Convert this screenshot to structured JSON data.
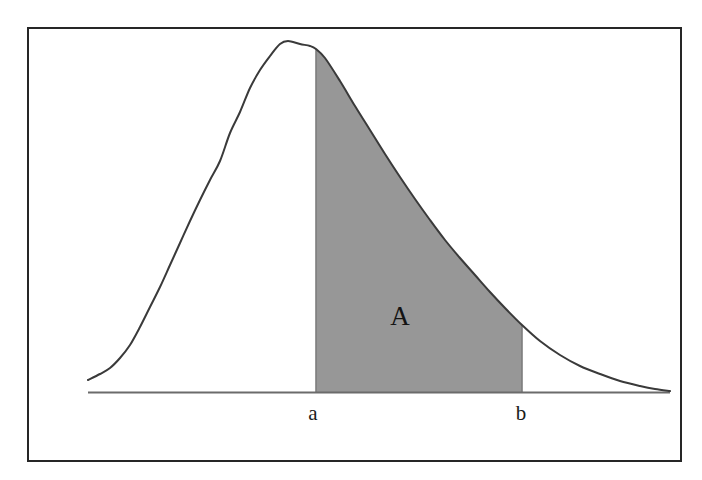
{
  "figure": {
    "title": "",
    "region_label": "A",
    "labels": {
      "lower_bound": "a",
      "upper_bound": "b"
    },
    "colors": {
      "frame": "#262626",
      "curve": "#3a3a3a",
      "shaded_region": "#979797",
      "baseline": "#6b6b6b",
      "background": "#ffffff",
      "text": "#141414"
    }
  },
  "chart_data": {
    "type": "area",
    "title": "",
    "subtitle": "",
    "xlabel": "",
    "ylabel": "",
    "grid": false,
    "legend_position": "none",
    "xlim": [
      88,
      670
    ],
    "ylim": [
      392,
      41
    ],
    "shaded_interval": {
      "from_label": "a",
      "to_label": "b",
      "from_x": 316,
      "to_x": 522,
      "fill": "#979797",
      "area_label": "A"
    },
    "annotations": [
      {
        "text": "a",
        "x": 313,
        "y": 413,
        "role": "x-tick-label"
      },
      {
        "text": "b",
        "x": 521,
        "y": 413,
        "role": "x-tick-label"
      },
      {
        "text": "A",
        "x": 400,
        "y": 317,
        "role": "area-label"
      }
    ],
    "baseline": {
      "y": 392,
      "x_start": 88,
      "x_end": 670
    },
    "curve_name": "right-skewed density curve",
    "x": [
      88,
      100,
      110,
      120,
      130,
      140,
      150,
      160,
      170,
      180,
      190,
      200,
      210,
      220,
      230,
      240,
      250,
      260,
      270,
      280,
      288,
      300,
      310,
      316,
      325,
      340,
      355,
      370,
      385,
      400,
      415,
      430,
      445,
      460,
      475,
      490,
      505,
      522,
      540,
      560,
      580,
      600,
      620,
      640,
      655,
      670
    ],
    "y": [
      380,
      374,
      368,
      358,
      345,
      327,
      307,
      287,
      265,
      243,
      221,
      200,
      180,
      161,
      133,
      112,
      88,
      70,
      56,
      44,
      41,
      44,
      46,
      49,
      58,
      81,
      106,
      130,
      154,
      177,
      199,
      220,
      240,
      258,
      275,
      292,
      308,
      325,
      341,
      355,
      366,
      374,
      381,
      386,
      389,
      391
    ]
  }
}
